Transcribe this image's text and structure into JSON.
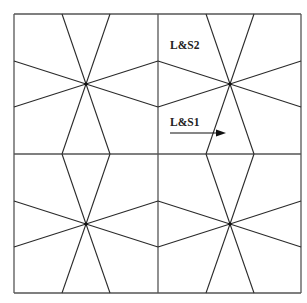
{
  "diagram": {
    "type": "star-lattice tiling",
    "grid": {
      "left": 14,
      "top": 14,
      "right": 301,
      "bottom": 293,
      "mid_x": 158,
      "mid_y": 154
    },
    "stars": [
      {
        "name": "star-top-left",
        "cx": 86,
        "cy": 84
      },
      {
        "name": "star-top-right",
        "cx": 230,
        "cy": 84
      },
      {
        "name": "star-bottom-left",
        "cx": 86,
        "cy": 224
      },
      {
        "name": "star-bottom-right",
        "cx": 230,
        "cy": 224
      }
    ],
    "spoke_offsets": {
      "dx": 24,
      "dy": 23
    },
    "labels": {
      "ls2": {
        "text": "L&S2",
        "x": 170,
        "y": 49
      },
      "ls1": {
        "text": "L&S1",
        "x": 170,
        "y": 126
      }
    },
    "arrow": {
      "x1": 170,
      "y1": 133,
      "x2": 226,
      "y2": 133
    },
    "colors": {
      "line": "#2a2a2a",
      "grid": "#555555",
      "background": "#ffffff"
    }
  }
}
